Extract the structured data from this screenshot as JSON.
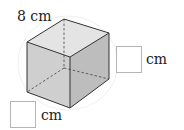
{
  "figure": {
    "type": "cube",
    "edge_label": "8 cm",
    "answer_boxes": [
      {
        "position": "right",
        "unit": "cm",
        "value": ""
      },
      {
        "position": "bottom-left",
        "unit": "cm",
        "value": ""
      }
    ],
    "colors": {
      "top_face": "#e4e4e4",
      "left_face": "#cfcfcf",
      "right_face": "#bdbdbd",
      "edge": "#333333",
      "box_border": "#b5b5b5"
    }
  }
}
